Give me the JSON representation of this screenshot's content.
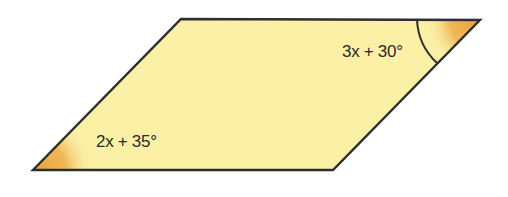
{
  "diagram": {
    "shape": "parallelogram",
    "fill_color": "#fbf0a6",
    "stroke_color": "#2e2e2e",
    "accent_color": "#e9a23b",
    "angles": [
      {
        "position": "top-right",
        "label": "3x + 30°",
        "marked_with_arc": true
      },
      {
        "position": "bottom-left",
        "label": "2x + 35°",
        "marked_with_arc": false
      }
    ]
  }
}
